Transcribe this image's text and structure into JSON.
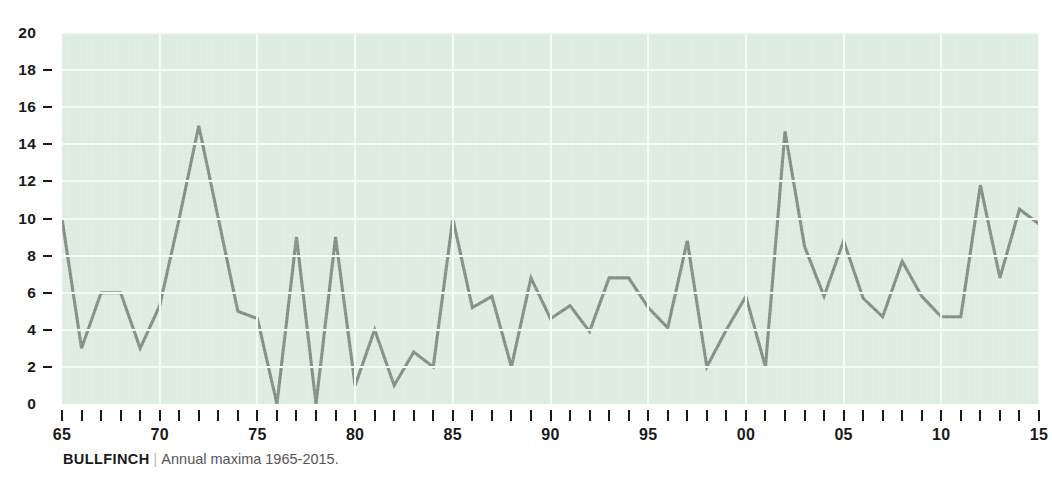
{
  "caption": {
    "source": "BULLFINCH",
    "separator": "|",
    "description": "Annual maxima 1965-2015."
  },
  "colors": {
    "plot_background": "#dcecdf",
    "gridline": "#f4faf5",
    "line": "#7d8a83",
    "axis_text": "#1a1a1a",
    "caption_text": "#555555"
  },
  "chart_data": {
    "type": "line",
    "title": "",
    "subtitle": "",
    "xlabel": "",
    "ylabel": "",
    "xlim": [
      1965,
      2015
    ],
    "ylim": [
      0,
      20
    ],
    "grid": true,
    "legend": "none",
    "y_ticks": [
      0,
      2,
      4,
      6,
      8,
      10,
      12,
      14,
      16,
      18,
      20
    ],
    "y_tick_labels": [
      "0",
      "2",
      "4",
      "6",
      "8",
      "10",
      "12",
      "14",
      "16",
      "18",
      "20"
    ],
    "x_ticks": [
      1965,
      1970,
      1975,
      1980,
      1985,
      1990,
      1995,
      2000,
      2005,
      2010,
      2015
    ],
    "x_tick_labels": [
      "65",
      "70",
      "75",
      "80",
      "85",
      "90",
      "95",
      "00",
      "05",
      "10",
      "15"
    ],
    "x_minor_tick_interval": 1,
    "series": [
      {
        "name": "Bullfinch annual maxima",
        "x": [
          1965,
          1966,
          1967,
          1968,
          1969,
          1970,
          1971,
          1972,
          1973,
          1974,
          1975,
          1976,
          1977,
          1978,
          1979,
          1980,
          1981,
          1982,
          1983,
          1984,
          1985,
          1986,
          1987,
          1988,
          1989,
          1990,
          1991,
          1992,
          1993,
          1994,
          1995,
          1996,
          1997,
          1998,
          1999,
          2000,
          2001,
          2002,
          2003,
          2004,
          2005,
          2006,
          2007,
          2008,
          2009,
          2010,
          2011,
          2012,
          2013,
          2014,
          2015
        ],
        "values": [
          10,
          3,
          6,
          6,
          3,
          5.3,
          10,
          15,
          10,
          5,
          4.6,
          0,
          9,
          0,
          9,
          1,
          4,
          1,
          2.8,
          2,
          10,
          5.2,
          5.8,
          2,
          6.8,
          4.6,
          5.3,
          3.9,
          6.8,
          6.8,
          5.2,
          4.1,
          8.8,
          2,
          4,
          5.8,
          2,
          14.7,
          8.5,
          5.8,
          8.8,
          5.7,
          4.7,
          7.7,
          5.8,
          4.7,
          4.7,
          11.8,
          6.8,
          10.5,
          9.7
        ]
      }
    ]
  }
}
